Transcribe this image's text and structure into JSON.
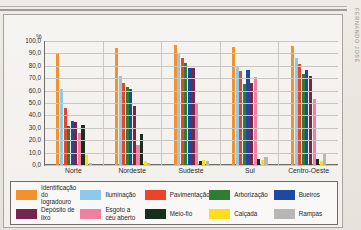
{
  "document": {
    "margin_stamp": "FERNANDO JOSÉ"
  },
  "chart": {
    "y_axis_unit": "%",
    "x_label": ""
  },
  "legend": {
    "rows": [
      [
        {
          "label": "Identificação\ndo logradouro",
          "color": "#F3912E"
        },
        {
          "label": "Iluminação",
          "color": "#8EC9EC"
        },
        {
          "label": "Pavimentação",
          "color": "#E8452A"
        },
        {
          "label": "Arborização",
          "color": "#2E7D32"
        },
        {
          "label": "Bueiros",
          "color": "#1F49A0"
        }
      ],
      [
        {
          "label": "Depósito de lixo",
          "color": "#76254D"
        },
        {
          "label": "Esgoto a\ncéu aberto",
          "color": "#F080A0"
        },
        {
          "label": "Meio-fio",
          "color": "#17301C"
        },
        {
          "label": "Calçada",
          "color": "#FCDE1C"
        },
        {
          "label": "Rampas",
          "color": "#B7B7B7"
        }
      ]
    ]
  },
  "chart_data": {
    "type": "bar",
    "title": "",
    "xlabel": "",
    "ylabel": "%",
    "ylim": [
      0,
      100
    ],
    "grid": true,
    "legend_position": "bottom",
    "tick_labels": [
      "0,0",
      "10,0",
      "20,0",
      "30,0",
      "40,0",
      "50,0",
      "60,0",
      "70,0",
      "80,0",
      "90,0",
      "100,0"
    ],
    "tick_values": [
      0,
      10,
      20,
      30,
      40,
      50,
      60,
      70,
      80,
      90,
      100
    ],
    "categories": [
      "Norte",
      "Nordeste",
      "Sudeste",
      "Sul",
      "Centro-Oeste"
    ],
    "series": [
      {
        "name": "Identificação do logradouro",
        "color": "#F3912E",
        "values": [
          89.8,
          94.5,
          97.0,
          95.5,
          95.6
        ]
      },
      {
        "name": "Iluminação",
        "color": "#8EC9EC",
        "values": [
          61.6,
          71.5,
          89.8,
          80.0,
          86.0
        ]
      },
      {
        "name": "Pavimentação",
        "color": "#E8452A",
        "values": [
          45.8,
          65.8,
          86.2,
          76.0,
          81.5
        ]
      },
      {
        "name": "Arborização",
        "color": "#2E7D32",
        "values": [
          31.8,
          63.3,
          82.0,
          65.5,
          73.8
        ]
      },
      {
        "name": "Bueiros",
        "color": "#1F49A0",
        "values": [
          35.8,
          61.0,
          78.5,
          77.0,
          76.6
        ]
      },
      {
        "name": "Depósito de lixo",
        "color": "#76254D",
        "values": [
          34.5,
          47.8,
          78.0,
          66.3,
          72.0
        ]
      },
      {
        "name": "Esgoto a céu aberto",
        "color": "#F080A0",
        "values": [
          25.5,
          16.5,
          50.2,
          71.0,
          53.0
        ]
      },
      {
        "name": "Meio-fio",
        "color": "#17301C",
        "values": [
          32.3,
          25.0,
          3.5,
          5.0,
          4.5
        ]
      },
      {
        "name": "Calçada",
        "color": "#FCDE1C",
        "values": [
          7.8,
          3.0,
          4.0,
          4.0,
          3.5
        ]
      },
      {
        "name": "Rampas",
        "color": "#B7B7B7",
        "values": [
          1.5,
          2.0,
          3.0,
          6.5,
          9.5
        ]
      }
    ]
  }
}
